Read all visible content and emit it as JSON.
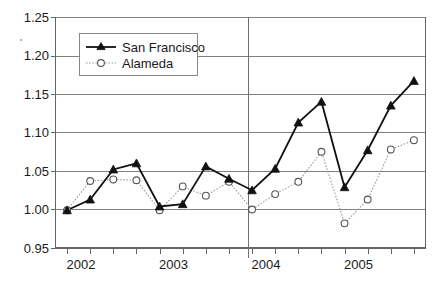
{
  "chart_data": {
    "type": "line",
    "title": "",
    "subtitle": "",
    "xlabel": "",
    "ylabel": "",
    "xlim": [
      2001.875,
      2005.875
    ],
    "ylim": [
      0.95,
      1.25
    ],
    "ytick_values": [
      0.95,
      1.0,
      1.05,
      1.1,
      1.15,
      1.2,
      1.25
    ],
    "ytick_labels": [
      "0.95",
      "1.00",
      "1.05",
      "1.10",
      "1.15",
      "1.20",
      "1.25"
    ],
    "xtick_labels": [
      "2002",
      "2003",
      "2004",
      "2005"
    ],
    "xtick_values": [
      2002,
      2003,
      2004,
      2005
    ],
    "minor_xticks": [
      2002.25,
      2002.5,
      2002.75,
      2003.25,
      2003.5,
      2003.75,
      2004.25,
      2004.5,
      2004.75,
      2005.25,
      2005.5,
      2005.75
    ],
    "grid": "horizontal",
    "legend_position": "upper-left-inside",
    "annotations": [
      {
        "name": "vertical-divider",
        "x": 2004,
        "note": "vertical reference line at 2004"
      }
    ],
    "x": [
      2002,
      2002.25,
      2002.5,
      2002.75,
      2003,
      2003.25,
      2003.5,
      2003.75,
      2004,
      2004.25,
      2004.5,
      2004.75,
      2005,
      2005.25,
      2005.5,
      2005.75
    ],
    "series": [
      {
        "name": "San Francisco",
        "marker": "filled-triangle",
        "linestyle": "solid",
        "color": "#111111",
        "values": [
          0.999,
          1.013,
          1.052,
          1.06,
          1.004,
          1.007,
          1.056,
          1.04,
          1.025,
          1.053,
          1.113,
          1.14,
          1.029,
          1.077,
          1.135,
          1.167
        ]
      },
      {
        "name": "Alameda",
        "marker": "open-circle",
        "linestyle": "dotted",
        "color": "#9a9a9a",
        "values": [
          0.999,
          1.037,
          1.039,
          1.038,
          0.999,
          1.03,
          1.018,
          1.036,
          1.0,
          1.02,
          1.036,
          1.075,
          0.982,
          1.013,
          1.078,
          1.09
        ]
      }
    ]
  },
  "legend": {
    "items": [
      {
        "label": "San Francisco"
      },
      {
        "label": "Alameda"
      }
    ]
  },
  "colors": {
    "series_sf": "#111111",
    "series_alameda": "#9a9a9a",
    "gridline": "#808080",
    "axis": "#666666",
    "text": "#1a1a1a",
    "background": "#ffffff"
  }
}
